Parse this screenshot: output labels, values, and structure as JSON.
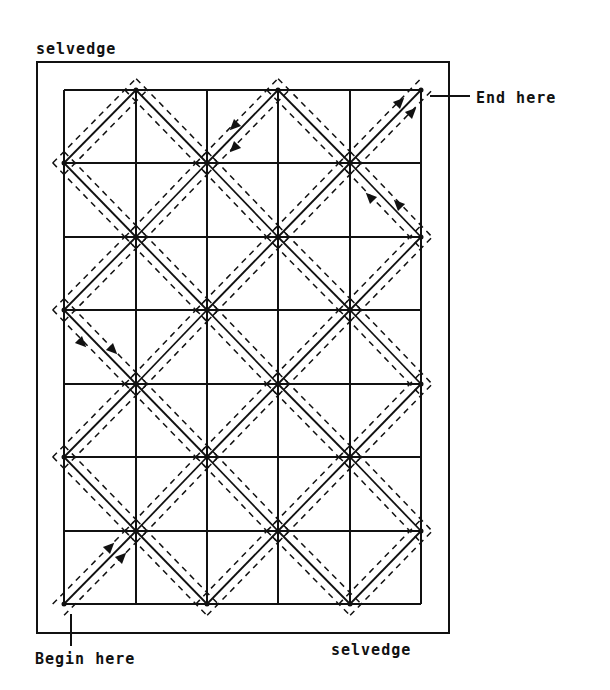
{
  "labels": {
    "selvedge_top": "selvedge",
    "selvedge_bottom": "selvedge",
    "end": "End here",
    "begin": "Begin here"
  },
  "colors": {
    "ink": "#111111",
    "background": "#ffffff"
  },
  "diagram": {
    "grid": {
      "columns": 5,
      "rows": 7,
      "x": [
        64,
        136,
        207,
        278,
        350,
        421
      ],
      "y": [
        90,
        163,
        237,
        310,
        384,
        457,
        531,
        604
      ]
    },
    "outer_rect": {
      "left": 37,
      "top": 62,
      "right": 449,
      "bottom": 633
    },
    "start_node": [
      0,
      7
    ],
    "end_node": [
      5,
      0
    ],
    "arrows": [
      {
        "x": 234,
        "y": 126,
        "dir": "sw"
      },
      {
        "x": 234,
        "y": 148,
        "dir": "sw"
      },
      {
        "x": 400,
        "y": 102,
        "dir": "ne"
      },
      {
        "x": 412,
        "y": 112,
        "dir": "ne"
      },
      {
        "x": 370,
        "y": 197,
        "dir": "nw"
      },
      {
        "x": 398,
        "y": 204,
        "dir": "nw"
      },
      {
        "x": 82,
        "y": 343,
        "dir": "se"
      },
      {
        "x": 113,
        "y": 350,
        "dir": "se"
      },
      {
        "x": 110,
        "y": 547,
        "dir": "ne"
      },
      {
        "x": 122,
        "y": 557,
        "dir": "ne"
      }
    ]
  }
}
